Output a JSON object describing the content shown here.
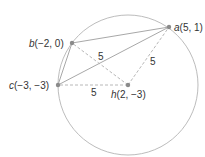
{
  "diagram": {
    "type": "geometry",
    "colors": {
      "circle": "#b4b4b4",
      "solid_line": "#a8a8a8",
      "dashed_line": "#b0b0b0",
      "point": "#8a8a8a",
      "text": "#333333"
    },
    "circle": {
      "center": "h",
      "radius": 5
    },
    "points": [
      {
        "id": "a",
        "name": "a",
        "coords": "(5, 1)"
      },
      {
        "id": "b",
        "name": "b",
        "coords": "(−2, 0)"
      },
      {
        "id": "c",
        "name": "c",
        "coords": "(−3, −3)"
      },
      {
        "id": "h",
        "name": "h",
        "coords": "(2, −3)"
      }
    ],
    "solid_segments": [
      [
        "a",
        "b"
      ],
      [
        "a",
        "c"
      ],
      [
        "b",
        "c"
      ]
    ],
    "dashed_segments": [
      {
        "from": "h",
        "to": "b",
        "label": "5"
      },
      {
        "from": "h",
        "to": "a",
        "label": "5"
      },
      {
        "from": "h",
        "to": "c",
        "label": "5"
      }
    ]
  }
}
